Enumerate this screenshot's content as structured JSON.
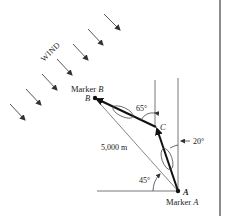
{
  "diagram": {
    "wind_label": "WIND",
    "marker_b_label": "Marker",
    "marker_b_letter": "B",
    "point_b": "B",
    "point_c": "C",
    "point_a": "A",
    "marker_a_label": "Marker",
    "marker_a_letter": "A",
    "distance_label": "5,000 m",
    "angle_65": "65°",
    "angle_20": "20°",
    "angle_45": "45°"
  },
  "colors": {
    "line": "#222222",
    "thin_line": "#555555",
    "border": "#666666"
  }
}
